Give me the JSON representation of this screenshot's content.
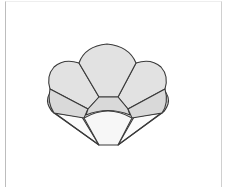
{
  "figure": {
    "colors": {
      "petal_fill": "#e2e2e2",
      "ring_fill": "#d9d9d9",
      "cup_fill": "#f7f7f7",
      "outline": "#3a3a3a",
      "frame": "#bdbdbd"
    },
    "parts": [
      "top-petal",
      "left-petal",
      "right-petal",
      "left-ring-segment",
      "center-ring-segment",
      "right-ring-segment",
      "left-outer-rim",
      "right-outer-rim",
      "bottom-cup",
      "left-side-panel",
      "right-side-panel"
    ]
  }
}
